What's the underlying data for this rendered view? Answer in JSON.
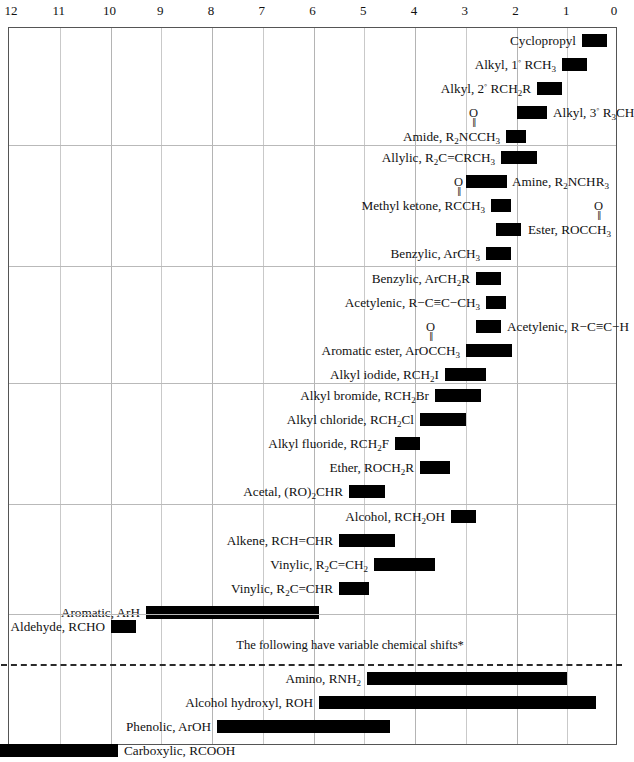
{
  "chart_data": {
    "type": "bar",
    "orientation": "horizontal-ranges",
    "title": "",
    "xlabel": "",
    "ylabel": "",
    "xlim": [
      12,
      0
    ],
    "axis_direction": "decreasing-left-to-right",
    "tick_labels": [
      "12",
      "11",
      "10",
      "9",
      "8",
      "7",
      "6",
      "5",
      "4",
      "3",
      "2",
      "1",
      "0"
    ],
    "ticks": [
      12,
      11,
      10,
      9,
      8,
      7,
      6,
      5,
      4,
      3,
      2,
      1,
      0
    ],
    "grid": true,
    "legend": null,
    "annotations": [
      "The following have variable chemical shifts*"
    ],
    "sections": [
      {
        "rows": [
          {
            "label": "Cyclopropyl",
            "label_side": "left",
            "start": 0.7,
            "end": 0.2,
            "carbonyl": false
          },
          {
            "label": "Alkyl, 1° RCH₃",
            "label_side": "left",
            "start": 1.1,
            "end": 0.6,
            "carbonyl": false
          },
          {
            "label": "Alkyl, 2° RCH₂R",
            "label_side": "left",
            "start": 1.6,
            "end": 1.1,
            "carbonyl": false
          },
          {
            "label": "Alkyl, 3° R₃CH",
            "label_side": "right",
            "start": 2.0,
            "end": 1.4,
            "carbonyl": false
          },
          {
            "label": "Amide, R₂NCCH₃",
            "label_side": "left",
            "start": 2.2,
            "end": 1.8,
            "carbonyl": true
          }
        ]
      },
      {
        "rows": [
          {
            "label": "Allylic, R₂C=CRCH₃",
            "label_side": "left",
            "start": 2.3,
            "end": 1.6,
            "carbonyl": false
          },
          {
            "label": "Amine, R₂NCHR₃",
            "label_side": "right",
            "start": 3.0,
            "end": 2.2,
            "carbonyl": false
          },
          {
            "label": "Methyl ketone, RCCH₃",
            "label_side": "left",
            "start": 2.5,
            "end": 2.1,
            "carbonyl": true
          },
          {
            "label": "Ester, ROCCH₃",
            "label_side": "right",
            "start": 2.4,
            "end": 1.9,
            "carbonyl": true
          },
          {
            "label": "Benzylic, ArCH₃",
            "label_side": "left",
            "start": 2.6,
            "end": 2.1,
            "carbonyl": false
          }
        ]
      },
      {
        "rows": [
          {
            "label": "Benzylic, ArCH₂R",
            "label_side": "left",
            "start": 2.8,
            "end": 2.3,
            "carbonyl": false
          },
          {
            "label": "Acetylenic, R−C≡C−CH₃",
            "label_side": "left",
            "start": 2.6,
            "end": 2.2,
            "carbonyl": false
          },
          {
            "label": "Acetylenic, R−C≡C−H",
            "label_side": "right",
            "start": 2.8,
            "end": 2.3,
            "carbonyl": false
          },
          {
            "label": "Aromatic ester, ArOCCH₃",
            "label_side": "left",
            "start": 3.0,
            "end": 2.1,
            "carbonyl": true
          },
          {
            "label": "Alkyl iodide, RCH₂I",
            "label_side": "left",
            "start": 3.4,
            "end": 2.6,
            "carbonyl": false
          }
        ]
      },
      {
        "rows": [
          {
            "label": "Alkyl bromide, RCH₂Br",
            "label_side": "left",
            "start": 3.6,
            "end": 2.7,
            "carbonyl": false
          },
          {
            "label": "Alkyl chloride, RCH₂Cl",
            "label_side": "left",
            "start": 3.9,
            "end": 3.0,
            "carbonyl": false
          },
          {
            "label": "Alkyl fluoride, RCH₂F",
            "label_side": "left",
            "start": 4.4,
            "end": 3.9,
            "carbonyl": false
          },
          {
            "label": "Ether, ROCH₂R",
            "label_side": "left",
            "start": 3.9,
            "end": 3.3,
            "carbonyl": false
          },
          {
            "label": "Acetal, (RO)₂CHR",
            "label_side": "left",
            "start": 5.3,
            "end": 4.6,
            "carbonyl": false
          }
        ]
      },
      {
        "rows": [
          {
            "label": "Alcohol, RCH₂OH",
            "label_side": "left",
            "start": 3.3,
            "end": 2.8,
            "carbonyl": false
          },
          {
            "label": "Alkene, RCH=CHR",
            "label_side": "left",
            "start": 5.5,
            "end": 4.4,
            "carbonyl": false
          },
          {
            "label": "Vinylic, R₂C=CH₂",
            "label_side": "left",
            "start": 4.8,
            "end": 3.6,
            "carbonyl": false
          },
          {
            "label": "Vinylic, R₂C=CHR",
            "label_side": "left",
            "start": 5.5,
            "end": 4.9,
            "carbonyl": false
          },
          {
            "label": "Aromatic, ArH",
            "label_side": "left",
            "start": 9.3,
            "end": 5.9,
            "carbonyl": false
          }
        ]
      },
      {
        "rows": [
          {
            "label": "Aldehyde, RCHO",
            "label_side": "left",
            "start": 10.0,
            "end": 9.5,
            "carbonyl": false
          }
        ]
      },
      {
        "rows": [
          {
            "label": "Amino, RNH₂",
            "label_side": "left",
            "start": 4.95,
            "end": 1.0,
            "carbonyl": false
          },
          {
            "label": "Alcohol hydroxyl, ROH",
            "label_side": "left",
            "start": 5.9,
            "end": 0.45,
            "carbonyl": false
          },
          {
            "label": "Phenolic, ArOH",
            "label_side": "left",
            "start": 7.9,
            "end": 4.5,
            "carbonyl": false
          },
          {
            "label": "Carboxylic, RCOOH",
            "label_side": "right",
            "start": 12.35,
            "end": 9.85,
            "carbonyl": false
          }
        ]
      }
    ]
  },
  "colors": {
    "bar": "#000000",
    "grid": "#c9c9c9",
    "frame": "#555555",
    "text": "#111111",
    "dashed_divider": "#2b2b2b"
  }
}
